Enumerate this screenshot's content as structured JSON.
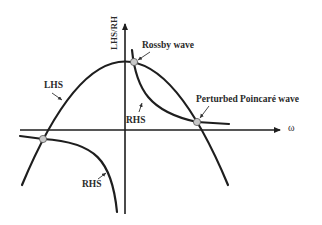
{
  "diagram": {
    "axes": {
      "y_label": "LHS/RH",
      "x_label": "ω"
    },
    "curves": {
      "lhs": {
        "label": "LHS"
      },
      "rhs_upper": {
        "label": "RHS"
      },
      "rhs_lower": {
        "label": "RHS"
      }
    },
    "intersections": {
      "rossby": {
        "label": "Rossby wave"
      },
      "poincare": {
        "label": "Perturbed Poincaré wave"
      },
      "left": {
        "label": ""
      }
    },
    "colors": {
      "curve": "#1e1e1e",
      "point_fill": "#c8c8c8",
      "background": "#ffffff"
    }
  }
}
